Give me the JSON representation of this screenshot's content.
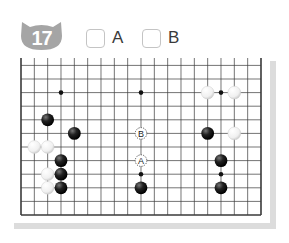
{
  "problem": {
    "number": "17",
    "badge_color": "#a5a5a5"
  },
  "options": [
    {
      "label": "A",
      "checked": false
    },
    {
      "label": "B",
      "checked": false
    }
  ],
  "board": {
    "size": 19,
    "visible_rows_from_bottom": 12,
    "grid": {
      "left": 21,
      "right": 261,
      "bottom": 215,
      "col_spacing": 13.333,
      "row_spacing": 13.6,
      "top_cut": 58
    },
    "line_color": "#3a3a3a",
    "background": "#ffffff",
    "edge_shadow": "#dcdcdc",
    "star_points": [
      {
        "col": 3,
        "row": 9
      },
      {
        "col": 9,
        "row": 9
      },
      {
        "col": 15,
        "row": 9
      },
      {
        "col": 3,
        "row": 3
      },
      {
        "col": 9,
        "row": 3
      },
      {
        "col": 15,
        "row": 3
      }
    ],
    "stones": [
      {
        "color": "black",
        "col": 2,
        "row": 7
      },
      {
        "color": "black",
        "col": 4,
        "row": 6
      },
      {
        "color": "white",
        "col": 1,
        "row": 5
      },
      {
        "color": "white",
        "col": 2,
        "row": 5
      },
      {
        "color": "black",
        "col": 3,
        "row": 4
      },
      {
        "color": "white",
        "col": 2,
        "row": 3
      },
      {
        "color": "black",
        "col": 3,
        "row": 3
      },
      {
        "color": "white",
        "col": 2,
        "row": 2
      },
      {
        "color": "black",
        "col": 3,
        "row": 2
      },
      {
        "color": "black",
        "col": 9,
        "row": 2
      },
      {
        "color": "white",
        "col": 14,
        "row": 9
      },
      {
        "color": "white",
        "col": 16,
        "row": 9
      },
      {
        "color": "black",
        "col": 14,
        "row": 6
      },
      {
        "color": "white",
        "col": 16,
        "row": 6
      },
      {
        "color": "black",
        "col": 15,
        "row": 4
      },
      {
        "color": "black",
        "col": 15,
        "row": 2
      }
    ],
    "markers": [
      {
        "label": "B",
        "col": 9,
        "row": 6
      },
      {
        "label": "A",
        "col": 9,
        "row": 4
      }
    ]
  }
}
